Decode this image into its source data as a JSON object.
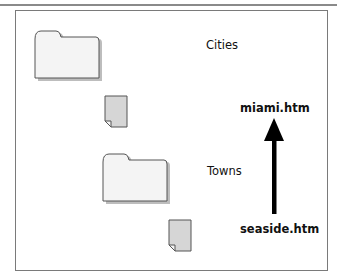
{
  "diagram": {
    "folders": [
      {
        "name": "Cities",
        "icon": "folder-icon"
      },
      {
        "name": "Towns",
        "icon": "folder-icon"
      }
    ],
    "files": [
      {
        "name": "miami.htm",
        "icon": "document-icon"
      },
      {
        "name": "seaside.htm",
        "icon": "document-icon"
      }
    ],
    "labels": {
      "cities": "Cities",
      "towns": "Towns",
      "miami": "miami.htm",
      "seaside": "seaside.htm"
    },
    "arrow": {
      "direction": "up",
      "from": "seaside.htm",
      "to": "miami.htm"
    },
    "colors": {
      "folder_fill": "#f4f4f4",
      "document_fill": "#d6d6d6",
      "outline": "#555555",
      "arrow": "#000000"
    }
  }
}
